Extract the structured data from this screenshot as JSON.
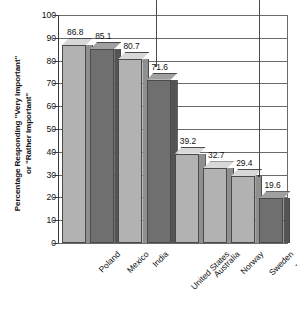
{
  "chart_data": {
    "type": "bar",
    "title": "",
    "xlabel": "",
    "ylabel": "Percentage Responding \"Very Important\"\nor \"Rather Important\"",
    "ylim": [
      0,
      100
    ],
    "ytick_step": 10,
    "grid": true,
    "legend": "none",
    "style": "3d-bars",
    "categories": [
      "Poland",
      "Mexico",
      "India",
      "United States",
      "Australia",
      "Norway",
      "Sweden",
      "Japan"
    ],
    "values": [
      86.8,
      85.1,
      80.7,
      71.6,
      39.2,
      32.7,
      29.4,
      19.6
    ],
    "value_labels": [
      "86.8",
      "85.1",
      "80.7",
      "71.6",
      "39.2",
      "32.7",
      "29.4",
      "19.6"
    ],
    "bar_shades": [
      "light",
      "dark",
      "light",
      "dark",
      "light",
      "light",
      "light",
      "dark"
    ],
    "ytick_labels": [
      "100",
      "90",
      "80",
      "70",
      "60",
      "50",
      "40",
      "30",
      "20",
      "10",
      "0"
    ]
  },
  "colors": {
    "bar_light_face": "#b2b2b2",
    "bar_light_top": "#d8d8d8",
    "bar_light_side": "#8f8f8f",
    "bar_dark_face": "#6f6f6f",
    "bar_dark_top": "#a0a0a0",
    "bar_dark_side": "#545454",
    "grid": "#6a6a6a",
    "axis": "#3a3a3a",
    "text": "#111111",
    "background": "#ffffff"
  },
  "annotations": {
    "leader_lines": [
      {
        "name": "leader-line-left",
        "target_label": "71.6"
      },
      {
        "name": "leader-line-right",
        "target_label": "29.4"
      }
    ]
  }
}
